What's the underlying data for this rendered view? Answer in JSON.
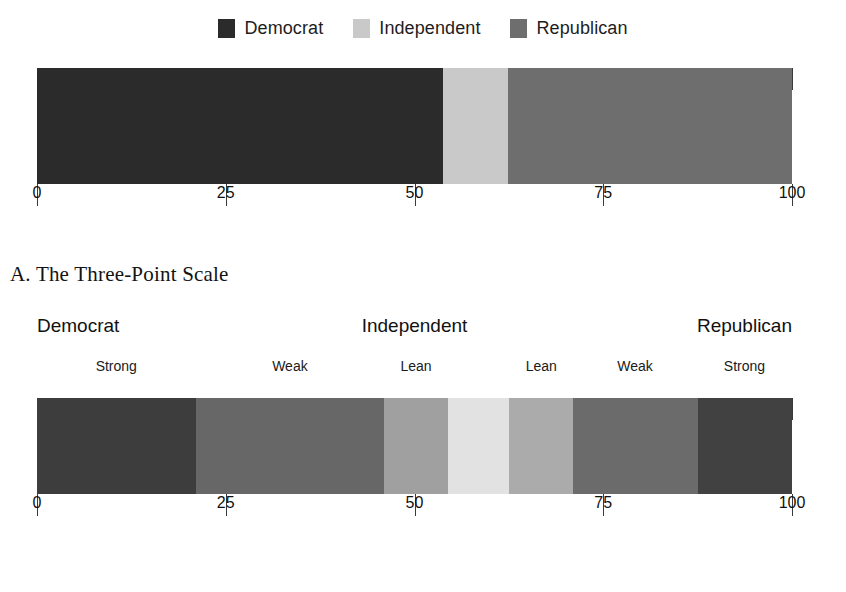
{
  "legend": {
    "items": [
      {
        "label": "Democrat",
        "color": "#2b2b2b",
        "icon": "legend-swatch-democrat"
      },
      {
        "label": "Independent",
        "color": "#c9c9c9",
        "icon": "legend-swatch-independent"
      },
      {
        "label": "Republican",
        "color": "#6e6e6e",
        "icon": "legend-swatch-republican"
      }
    ]
  },
  "caption_a": "A.  The Three-Point Scale",
  "axis": {
    "ticks": [
      0,
      25,
      50,
      75,
      100
    ],
    "tick_labels": [
      "0",
      "25",
      "50",
      "75",
      "100"
    ],
    "min": 0,
    "max": 100
  },
  "scale_headers": {
    "left": "Democrat",
    "center": "Independent",
    "right": "Republican"
  },
  "sub_labels": [
    {
      "text": "Strong",
      "pos": 10.5
    },
    {
      "text": "Weak",
      "pos": 33.5
    },
    {
      "text": "Lean",
      "pos": 50.2
    },
    {
      "text": "Lean",
      "pos": 66.8
    },
    {
      "text": "Weak",
      "pos": 79.2
    },
    {
      "text": "Strong",
      "pos": 93.7
    }
  ],
  "chart_data": [
    {
      "id": "three-point-scale",
      "type": "bar",
      "orientation": "horizontal",
      "stacked": true,
      "title": "",
      "xlabel": "",
      "ylabel": "",
      "xlim": [
        0,
        100
      ],
      "grid": false,
      "legend_position": "top-center",
      "categories": [
        "Party identification"
      ],
      "series": [
        {
          "name": "Democrat",
          "values": [
            53.8
          ],
          "color": "#2b2b2b"
        },
        {
          "name": "Independent",
          "values": [
            8.6
          ],
          "color": "#c9c9c9"
        },
        {
          "name": "Republican",
          "values": [
            37.6
          ],
          "color": "#6e6e6e"
        }
      ],
      "boundaries": [
        0,
        53.8,
        62.4,
        100
      ],
      "tick_labels": [
        "0",
        "25",
        "50",
        "75",
        "100"
      ]
    },
    {
      "id": "seven-point-scale",
      "type": "bar",
      "orientation": "horizontal",
      "stacked": true,
      "title": "",
      "xlabel": "",
      "ylabel": "",
      "xlim": [
        0,
        100
      ],
      "grid": false,
      "legend_position": "none",
      "categories": [
        "Party identification"
      ],
      "series": [
        {
          "name": "Strong Democrat",
          "values": [
            21.0
          ],
          "color": "#3d3d3d"
        },
        {
          "name": "Weak Democrat",
          "values": [
            25.0
          ],
          "color": "#676767"
        },
        {
          "name": "Lean Democrat",
          "values": [
            8.5
          ],
          "color": "#a0a0a0"
        },
        {
          "name": "Independent",
          "values": [
            8.0
          ],
          "color": "#e2e2e2"
        },
        {
          "name": "Lean Republican",
          "values": [
            8.5
          ],
          "color": "#ababab"
        },
        {
          "name": "Weak Republican",
          "values": [
            16.5
          ],
          "color": "#6b6b6b"
        },
        {
          "name": "Strong Republican",
          "values": [
            12.5
          ],
          "color": "#414141"
        }
      ],
      "boundaries": [
        0,
        21,
        46,
        54.5,
        62.5,
        71,
        87.5,
        100
      ],
      "tick_labels": [
        "0",
        "25",
        "50",
        "75",
        "100"
      ]
    }
  ]
}
